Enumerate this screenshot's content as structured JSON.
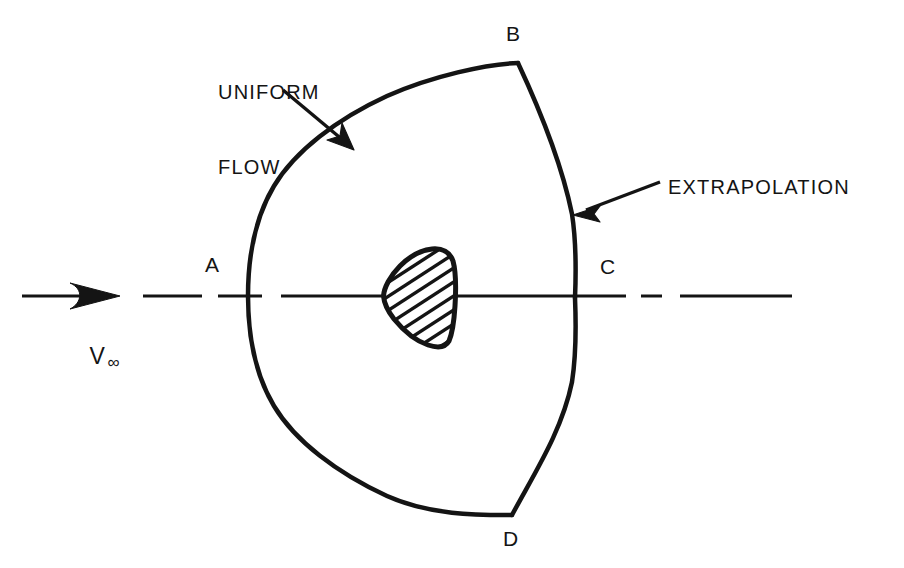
{
  "figure": {
    "background_color": "#ffffff",
    "line_color": "#141414",
    "text_color": "#141414"
  },
  "annotations": {
    "uniform_flow": {
      "line1": "UNIFORM",
      "line2": "FLOW",
      "x": 218,
      "y": 30
    },
    "extrapolation": {
      "text": "EXTRAPOLATION",
      "x": 668,
      "y": 175
    }
  },
  "points": [
    {
      "id": "A",
      "label": "A",
      "label_x": 205,
      "label_y": 253,
      "point_x": 248,
      "point_y": 296
    },
    {
      "id": "B",
      "label": "B",
      "label_x": 506,
      "label_y": 22,
      "point_x": 518,
      "point_y": 63
    },
    {
      "id": "C",
      "label": "C",
      "label_x": 600,
      "label_y": 255,
      "point_x": 575,
      "point_y": 298
    },
    {
      "id": "D",
      "label": "D",
      "label_x": 503,
      "label_y": 527,
      "point_x": 512,
      "point_y": 515
    }
  ],
  "freestream": {
    "symbol": "V",
    "subscript": "∞",
    "x": 62,
    "y": 316
  },
  "centerline": {
    "style": "dash-dot",
    "y": 296
  },
  "body": {
    "name": "blunt-body",
    "hatched": true,
    "hatch_angle_deg": 33
  }
}
